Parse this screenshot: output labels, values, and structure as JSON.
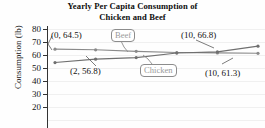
{
  "chart_data": {
    "type": "line",
    "title": "Yearly Per Capita Consumption of Chicken and Beef",
    "title_line1": "Yearly Per Capita Consumption of",
    "title_line2": "Chicken and Beef",
    "xlabel": "",
    "ylabel": "Consumption (lb)",
    "ylim": [
      20,
      80
    ],
    "yticks": [
      80,
      70,
      60,
      50,
      40,
      30,
      20
    ],
    "ytick_labels": [
      "80",
      "70",
      "60",
      "50",
      "40",
      "30",
      "20"
    ],
    "xlim": [
      0,
      10
    ],
    "grid": true,
    "legend": "none",
    "series": [
      {
        "name": "Beef",
        "color": "#8a8a8a",
        "x": [
          0,
          2,
          4,
          6,
          8,
          10
        ],
        "values": [
          64.5,
          64.0,
          62.8,
          61.9,
          61.6,
          61.3
        ]
      },
      {
        "name": "Chicken",
        "color": "#6f6f6f",
        "x": [
          0,
          2,
          4,
          6,
          8,
          10
        ],
        "values": [
          54.2,
          56.8,
          58.0,
          61.5,
          62.4,
          66.8
        ]
      }
    ],
    "annotations": [
      {
        "text": "(0, 64.5)",
        "series": "Beef",
        "x": 0,
        "y": 64.5
      },
      {
        "text": "(10, 61.3)",
        "series": "Beef",
        "x": 10,
        "y": 61.3
      },
      {
        "text": "(2, 56.8)",
        "series": "Chicken",
        "x": 2,
        "y": 56.8
      },
      {
        "text": "(10, 66.8)",
        "series": "Chicken",
        "x": 10,
        "y": 66.8
      }
    ],
    "callouts": [
      {
        "label": "Beef"
      },
      {
        "label": "Chicken"
      }
    ]
  },
  "axis": {
    "y_label": "Consumption (lb)",
    "ticks": [
      "80",
      "70",
      "60",
      "50",
      "40",
      "30",
      "20"
    ]
  },
  "labels": {
    "title_line1": "Yearly Per Capita Consumption of",
    "title_line2": "Chicken and Beef",
    "beef": "Beef",
    "chicken": "Chicken",
    "ann_beef_left": "(0, 64.5)",
    "ann_beef_right": "(10, 61.3)",
    "ann_chicken_left": "(2, 56.8)",
    "ann_chicken_right": "(10, 66.8)"
  }
}
